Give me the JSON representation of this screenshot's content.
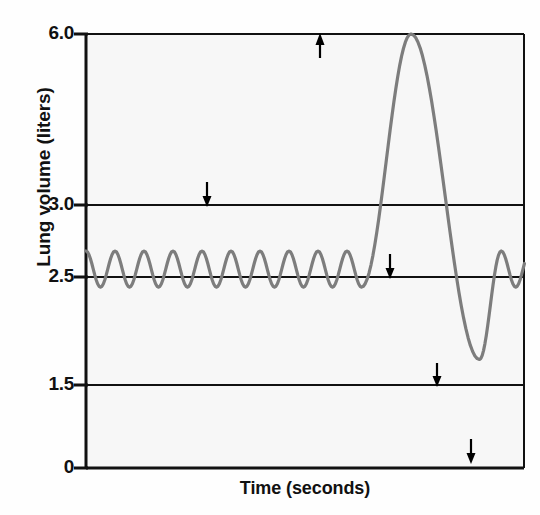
{
  "chart_data": {
    "type": "line",
    "title": "",
    "subtitle": "",
    "xlabel": "Time (seconds)",
    "ylabel": "Lung volume (liters)",
    "ylim": [
      0,
      6.0
    ],
    "xlim": [
      0,
      100
    ],
    "y_ticks": [
      "6.0",
      "3.0",
      "2.5",
      "1.5",
      "0"
    ],
    "y_tick_values": [
      6.0,
      3.0,
      2.5,
      1.5,
      0
    ],
    "x_ticks": [],
    "grid": "horizontal-reference-lines-at-y-ticks",
    "legend": "none",
    "series": [
      {
        "name": "Spirogram (lung volume trace)",
        "color": "#7d7d7d",
        "description": "Tidal breathing oscillating between 2.5 and 3.0 liters, interrupted by one maximal inspiration to 6.0 liters followed by maximal expiration to 1.5 liters, then tidal breathing resumes.",
        "tidal_min": 2.5,
        "tidal_max": 3.0,
        "deep_breath_peak": 6.0,
        "deep_breath_trough": 1.5,
        "tidal_cycles_before_deep_breath": 9,
        "tidal_cycles_after_deep_breath": 5
      }
    ],
    "annotations": [
      {
        "label": "A",
        "value": 3.0,
        "points_to": "peak of normal tidal breath (3.0 L)",
        "direction": "down"
      },
      {
        "label": "B",
        "value": 6.0,
        "points_to": "peak of maximal inspiration (6.0 L)",
        "direction": "up"
      },
      {
        "label": "C",
        "value": 2.5,
        "points_to": "trough of normal tidal breath (2.5 L)",
        "direction": "down"
      },
      {
        "label": "D",
        "value": 1.5,
        "points_to": "maximal expiration level (1.5 L)",
        "direction": "down"
      },
      {
        "label": "E",
        "value": 0,
        "points_to": "zero volume baseline (0 L)",
        "direction": "down"
      }
    ],
    "colors": {
      "trace": "#7d7d7d",
      "axis": "#111111",
      "reference_line": "#111111",
      "plot_background": "#f7f7f7",
      "figure_background": "#fefefe"
    }
  },
  "axis": {
    "y_label": "Lung volume (liters)",
    "x_label": "Time (seconds)",
    "ticks": {
      "t6": "6.0",
      "t3": "3.0",
      "t25": "2.5",
      "t15": "1.5",
      "t0": "0"
    }
  },
  "annotations": {
    "a": "A",
    "b": "B",
    "c": "C",
    "d": "D",
    "e": "E"
  }
}
